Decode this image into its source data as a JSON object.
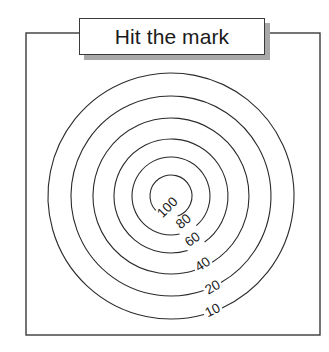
{
  "figure": {
    "title": "Hit the mark",
    "background_color": "#ffffff",
    "line_color": "#2b2b2b",
    "frame_color": "#3a3a3a",
    "shadow_color": "#a8a8a8"
  },
  "chart_data": {
    "type": "contour",
    "title": "Hit the mark",
    "xlabel": "",
    "ylabel": "",
    "grid": false,
    "legend": false,
    "center": {
      "x": 171,
      "y": 196
    },
    "contour_levels": [
      10,
      20,
      40,
      60,
      80,
      100
    ],
    "contours": [
      {
        "label": "10",
        "radius": 123,
        "label_x": 213,
        "label_y": 311,
        "label_angle": -26
      },
      {
        "label": "20",
        "radius": 100,
        "label_x": 213,
        "label_y": 288,
        "label_angle": -30
      },
      {
        "label": "40",
        "radius": 78,
        "label_x": 203,
        "label_y": 265,
        "label_angle": -33
      },
      {
        "label": "60",
        "radius": 57,
        "label_x": 193,
        "label_y": 240,
        "label_angle": -36
      },
      {
        "label": "80",
        "radius": 39,
        "label_x": 184,
        "label_y": 222,
        "label_angle": -40
      },
      {
        "label": "100",
        "radius": 21,
        "label_x": 168,
        "label_y": 208,
        "label_angle": -45
      }
    ],
    "axis_ranges": {
      "x": [
        26,
        320
      ],
      "y": [
        33,
        335
      ]
    }
  }
}
